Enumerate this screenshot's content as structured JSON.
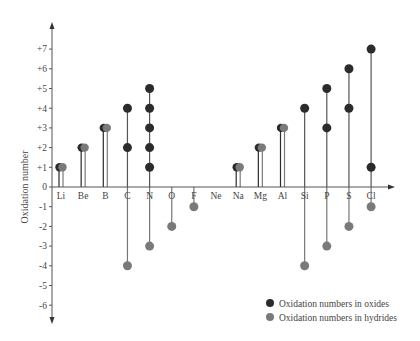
{
  "chart_data": {
    "type": "scatter",
    "subtype": "lollipop",
    "title": "",
    "xlabel": "",
    "ylabel": "Oxidation number",
    "ylim": [
      -6,
      7
    ],
    "y_ticks": [
      "+7",
      "+6",
      "+5",
      "+4",
      "+3",
      "+2",
      "+1",
      "0",
      "-1",
      "-2",
      "-3",
      "-4",
      "-5",
      "-6"
    ],
    "y_tick_values": [
      7,
      6,
      5,
      4,
      3,
      2,
      1,
      0,
      -1,
      -2,
      -3,
      -4,
      -5,
      -6
    ],
    "grid": false,
    "legend_position": "bottom-right",
    "categories": [
      "Li",
      "Be",
      "B",
      "C",
      "N",
      "O",
      "F",
      "Ne",
      "Na",
      "Mg",
      "Al",
      "Si",
      "P",
      "S",
      "Cl"
    ],
    "series": [
      {
        "name": "Oxidation numbers in oxides",
        "color": "#2b2b2b",
        "values": [
          [
            1
          ],
          [
            2
          ],
          [
            3
          ],
          [
            2,
            4
          ],
          [
            1,
            2,
            3,
            4,
            5
          ],
          [],
          [],
          [],
          [
            1
          ],
          [
            2
          ],
          [
            3
          ],
          [
            4
          ],
          [
            3,
            5
          ],
          [
            4,
            6
          ],
          [
            1,
            7
          ]
        ]
      },
      {
        "name": "Oxidation numbers in hydrides",
        "color": "#7a7a7a",
        "values": [
          [
            1
          ],
          [
            2
          ],
          [
            3
          ],
          [
            -4
          ],
          [
            -3
          ],
          [
            -2
          ],
          [
            -1
          ],
          [],
          [
            1
          ],
          [
            2
          ],
          [
            3
          ],
          [
            -4
          ],
          [
            -3
          ],
          [
            -2
          ],
          [
            -1
          ]
        ]
      }
    ]
  },
  "legend": {
    "items": [
      {
        "label": "Oxidation numbers in oxides",
        "color": "#2b2b2b"
      },
      {
        "label": "Oxidation numbers in hydrides",
        "color": "#7a7a7a"
      }
    ]
  }
}
